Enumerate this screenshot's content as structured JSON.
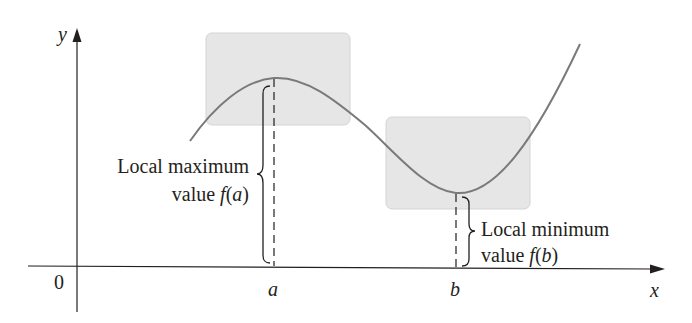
{
  "figure": {
    "axes": {
      "x_label": "x",
      "y_label": "y",
      "origin_label": "0",
      "ticks": [
        {
          "name": "a",
          "label": "a"
        },
        {
          "name": "b",
          "label": "b"
        }
      ]
    },
    "annotations": {
      "local_max": {
        "line1": "Local maximum",
        "line2_prefix": "value ",
        "func": "f",
        "open": "(",
        "arg": "a",
        "close": ")"
      },
      "local_min": {
        "line1": "Local minimum",
        "line2_prefix": "value ",
        "func": "f",
        "open": "(",
        "arg": "b",
        "close": ")"
      }
    },
    "colors": {
      "curve": "#7a7a7a",
      "axes": "#231f20",
      "highlight_box": "#e6e6e6",
      "highlight_box_border": "#d4d4d4",
      "text": "#231f20"
    }
  }
}
